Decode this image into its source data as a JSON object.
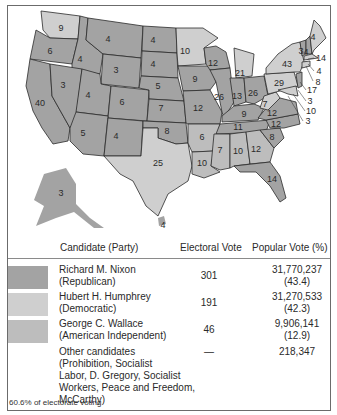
{
  "map": {
    "title": "1968 Presidential Election",
    "colors": {
      "republican": "#a3a3a3",
      "democratic": "#cfcfcf",
      "american_independent": "#bdbdbd",
      "water": "#ffffff",
      "border": "#2b2b2b"
    },
    "states": [
      {
        "label": "WA",
        "votes": "9",
        "party": "democratic"
      },
      {
        "label": "OR",
        "votes": "6",
        "party": "republican"
      },
      {
        "label": "CA",
        "votes": "40",
        "party": "republican"
      },
      {
        "label": "ID",
        "votes": "4",
        "party": "republican"
      },
      {
        "label": "NV",
        "votes": "3",
        "party": "republican"
      },
      {
        "label": "MT",
        "votes": "4",
        "party": "republican"
      },
      {
        "label": "WY",
        "votes": "3",
        "party": "republican"
      },
      {
        "label": "UT",
        "votes": "4",
        "party": "republican"
      },
      {
        "label": "AZ",
        "votes": "5",
        "party": "republican"
      },
      {
        "label": "CO",
        "votes": "6",
        "party": "republican"
      },
      {
        "label": "NM",
        "votes": "4",
        "party": "republican"
      },
      {
        "label": "ND",
        "votes": "4",
        "party": "republican"
      },
      {
        "label": "SD",
        "votes": "4",
        "party": "republican"
      },
      {
        "label": "NE",
        "votes": "5",
        "party": "republican"
      },
      {
        "label": "KS",
        "votes": "7",
        "party": "republican"
      },
      {
        "label": "OK",
        "votes": "8",
        "party": "republican"
      },
      {
        "label": "TX",
        "votes": "25",
        "party": "democratic"
      },
      {
        "label": "MN",
        "votes": "10",
        "party": "democratic"
      },
      {
        "label": "IA",
        "votes": "9",
        "party": "republican"
      },
      {
        "label": "MO",
        "votes": "12",
        "party": "republican"
      },
      {
        "label": "AR",
        "votes": "6",
        "party": "american_independent"
      },
      {
        "label": "LA",
        "votes": "10",
        "party": "american_independent"
      },
      {
        "label": "WI",
        "votes": "12",
        "party": "republican"
      },
      {
        "label": "IL",
        "votes": "26",
        "party": "republican"
      },
      {
        "label": "MI",
        "votes": "21",
        "party": "democratic"
      },
      {
        "label": "IN",
        "votes": "13",
        "party": "republican"
      },
      {
        "label": "OH",
        "votes": "26",
        "party": "republican"
      },
      {
        "label": "KY",
        "votes": "9",
        "party": "republican"
      },
      {
        "label": "TN",
        "votes": "11",
        "party": "republican"
      },
      {
        "label": "MS",
        "votes": "7",
        "party": "american_independent"
      },
      {
        "label": "AL",
        "votes": "10",
        "party": "american_independent"
      },
      {
        "label": "GA",
        "votes": "12",
        "party": "american_independent"
      },
      {
        "label": "FL",
        "votes": "14",
        "party": "republican"
      },
      {
        "label": "SC",
        "votes": "8",
        "party": "republican"
      },
      {
        "label": "NC",
        "votes": "12",
        "party": "republican"
      },
      {
        "label": "VA",
        "votes": "12",
        "party": "republican"
      },
      {
        "label": "WV",
        "votes": "7",
        "party": "democratic"
      },
      {
        "label": "PA",
        "votes": "29",
        "party": "democratic"
      },
      {
        "label": "NY",
        "votes": "43",
        "party": "democratic"
      },
      {
        "label": "VT",
        "votes": "3",
        "party": "republican"
      },
      {
        "label": "NH",
        "votes": "4",
        "party": "republican"
      },
      {
        "label": "ME",
        "votes": "4",
        "party": "democratic"
      },
      {
        "label": "MA",
        "votes": "14",
        "party": "democratic"
      },
      {
        "label": "RI",
        "votes": "4",
        "party": "democratic"
      },
      {
        "label": "CT",
        "votes": "8",
        "party": "democratic"
      },
      {
        "label": "NJ",
        "votes": "17",
        "party": "republican"
      },
      {
        "label": "DE",
        "votes": "3",
        "party": "republican"
      },
      {
        "label": "MD",
        "votes": "10",
        "party": "democratic"
      },
      {
        "label": "DC",
        "votes": "3",
        "party": "democratic"
      },
      {
        "label": "AK",
        "votes": "3",
        "party": "republican"
      },
      {
        "label": "HI",
        "votes": "4",
        "party": "democratic"
      }
    ]
  },
  "table": {
    "headers": {
      "candidate": "Candidate (Party)",
      "electoral": "Electoral Vote",
      "popular": "Popular Vote (%)"
    },
    "rows": [
      {
        "name": "Richard M. Nixon",
        "party": "(Republican)",
        "electoral": "301",
        "popular": "31,770,237",
        "percent": "(43.4)",
        "swatch": "#a3a3a3"
      },
      {
        "name": "Hubert H. Humphrey",
        "party": "(Democratic)",
        "electoral": "191",
        "popular": "31,270,533",
        "percent": "(42.3)",
        "swatch": "#cfcfcf"
      },
      {
        "name": "George C. Wallace",
        "party": "(American Independent)",
        "electoral": "46",
        "popular": "9,906,141",
        "percent": "(12.9)",
        "swatch": "#bdbdbd"
      },
      {
        "name": "Other candidates",
        "party_lines": [
          "(Prohibition, Socialist",
          "Labor, D. Gregory, Socialist",
          "Workers, Peace and Freedom,",
          "McCarthy)"
        ],
        "electoral": "—",
        "popular": "218,347"
      }
    ],
    "footnote": "60.6% of electorate voting"
  }
}
